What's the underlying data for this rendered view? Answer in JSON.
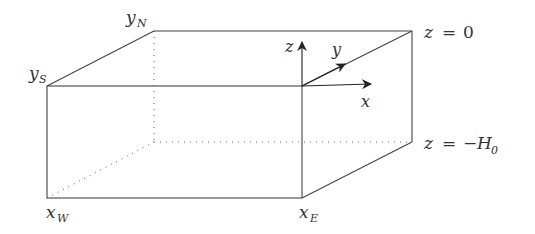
{
  "diagram": {
    "type": "3d-box-domain",
    "colors": {
      "line": "#444444",
      "text": "#333333",
      "background": "#ffffff"
    },
    "corner_labels": {
      "y_north": {
        "base": "y",
        "sub": "N"
      },
      "y_south": {
        "base": "y",
        "sub": "S"
      },
      "x_west": {
        "base": "x",
        "sub": "W"
      },
      "x_east": {
        "base": "x",
        "sub": "E"
      }
    },
    "surface_labels": {
      "top": {
        "lhs": "z",
        "eq": "=",
        "rhs": "0"
      },
      "bottom": {
        "lhs": "z",
        "eq": "=",
        "minus": "−",
        "rhs": "H",
        "rhs_sub": "0"
      }
    },
    "axes": {
      "x": "x",
      "y": "y",
      "z": "z"
    }
  }
}
